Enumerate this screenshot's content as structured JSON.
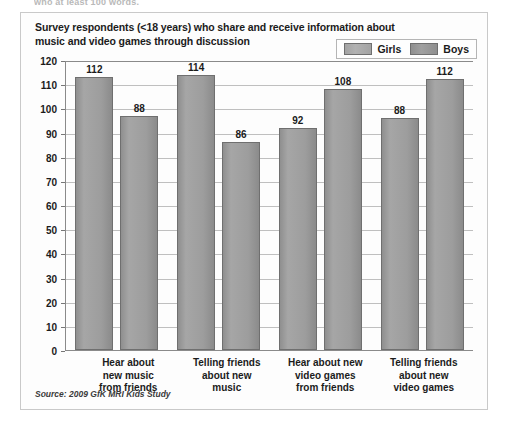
{
  "page": {
    "cut_off_header": "who at least 100 words."
  },
  "figure": {
    "title": "Survey respondents (<18 years) who share and receive information about music and video games through discussion",
    "source": "Source: 2009 GfK MRI Kids Study"
  },
  "legend": {
    "items": [
      {
        "label": "Girls",
        "color": "#a3a3a3"
      },
      {
        "label": "Boys",
        "color": "#8f8f8f"
      }
    ]
  },
  "chart_data": {
    "type": "bar",
    "title": "Survey respondents (<18 years) who share and receive information about music and video games through discussion",
    "xlabel": "",
    "ylabel": "",
    "ylim": [
      0,
      120
    ],
    "yticks": [
      0,
      10,
      20,
      30,
      40,
      50,
      60,
      70,
      80,
      90,
      100,
      110,
      120
    ],
    "grid": true,
    "legend_position": "top-right",
    "categories": [
      "Hear about new music from friends",
      "Telling friends about new music",
      "Hear about new video games from friends",
      "Telling friends about new video games"
    ],
    "category_lines": [
      [
        "Hear about",
        "new music",
        "from friends"
      ],
      [
        "Telling friends",
        "about new",
        "music"
      ],
      [
        "Hear about new",
        "video games",
        "from friends"
      ],
      [
        "Telling friends",
        "about new",
        "video games"
      ]
    ],
    "series": [
      {
        "name": "Girls",
        "color": "#a3a3a3",
        "values": [
          112,
          114,
          92,
          88
        ],
        "plotted_heights": [
          113,
          114,
          92,
          96
        ]
      },
      {
        "name": "Boys",
        "color": "#8f8f8f",
        "values": [
          88,
          86,
          108,
          112
        ],
        "plotted_heights": [
          97,
          86,
          108,
          112
        ]
      }
    ],
    "data_labels": [
      {
        "group": 0,
        "series": "Girls",
        "text": "112"
      },
      {
        "group": 0,
        "series": "Boys",
        "text": "88"
      },
      {
        "group": 1,
        "series": "Girls",
        "text": "114"
      },
      {
        "group": 1,
        "series": "Boys",
        "text": "86"
      },
      {
        "group": 2,
        "series": "Girls",
        "text": "92"
      },
      {
        "group": 2,
        "series": "Boys",
        "text": "108"
      },
      {
        "group": 3,
        "series": "Girls",
        "text": "88"
      },
      {
        "group": 3,
        "series": "Boys",
        "text": "112"
      }
    ],
    "source": "Source: 2009 GfK MRI Kids Study"
  }
}
